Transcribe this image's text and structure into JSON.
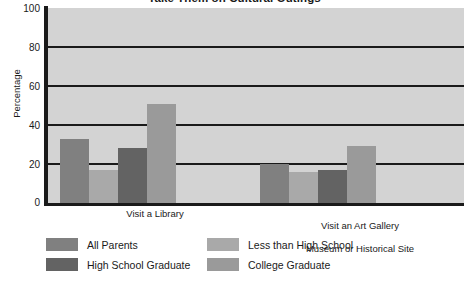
{
  "chart_data": {
    "type": "bar",
    "title": "Take Them on Cultural Outings",
    "xlabel": "",
    "ylabel": "Percentage",
    "ylim": [
      0,
      100
    ],
    "yticks": [
      "0",
      "20",
      "40",
      "60",
      "80",
      "100"
    ],
    "grid": true,
    "legend_position": "bottom",
    "categories": [
      "Visit a Library",
      "Visit an Art Gallery\nMuseum or Historical Site"
    ],
    "series": [
      {
        "name": "All Parents",
        "color": "#808080",
        "values": [
          33,
          20
        ]
      },
      {
        "name": "Less than High School",
        "color": "#a9a9a9",
        "values": [
          17,
          16
        ]
      },
      {
        "name": "High School Graduate",
        "color": "#636363",
        "values": [
          28,
          17
        ]
      },
      {
        "name": "College Graduate",
        "color": "#9a9a9a",
        "values": [
          51,
          29
        ]
      }
    ],
    "plot_background": "#d3d3d3",
    "axis_color": "#1a1a1a",
    "gridline_color": "#1a1a1a"
  },
  "axis": {
    "y_title": "Percentage",
    "tick_0": "0",
    "tick_20": "20",
    "tick_40": "40",
    "tick_60": "60",
    "tick_80": "80",
    "tick_100": "100"
  },
  "groups": {
    "group_1_label": "Visit a Library",
    "group_2_line1": "Visit an Art Gallery",
    "group_2_line2": "Museum or Historical Site"
  },
  "legend": {
    "item_1": "All Parents",
    "item_2": "Less than High School",
    "item_3": "High School Graduate",
    "item_4": "College Graduate"
  },
  "title": "Take Them on Cultural Outings"
}
